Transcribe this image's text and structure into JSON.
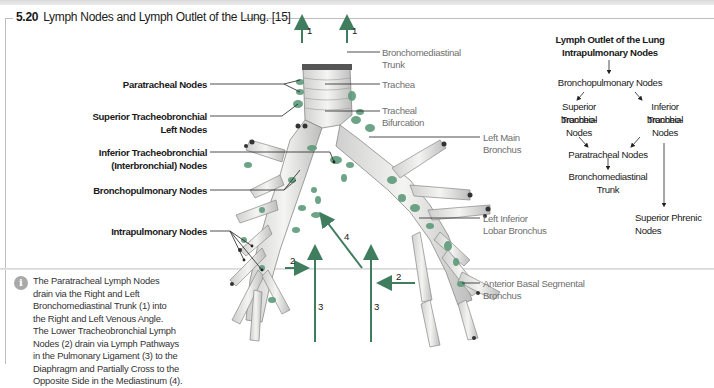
{
  "figure": {
    "number": "5.20",
    "title": "Lymph Nodes and Lymph Outlet of the Lung. [15]"
  },
  "colors": {
    "accent_green": "#3f7d5e",
    "node_green": "#5e9a7a",
    "label_grey": "#6f6f6f",
    "rule_grey": "#bdbdbd"
  },
  "left_labels": {
    "paratracheal": "Paratracheal Nodes",
    "sup_tracheo_1": "Superior Tracheobronchial",
    "sup_tracheo_2": "Left Nodes",
    "inf_tracheo_1": "Inferior Tracheobronchial",
    "inf_tracheo_2": "(Interbronchial) Nodes",
    "bronchopulmonary": "Bronchopulmonary Nodes",
    "intrapulmonary": "Intrapulmonary Nodes"
  },
  "right_labels": {
    "bronchomediastinal_1": "Bronchomediastinal",
    "bronchomediastinal_2": "Trunk",
    "trachea": "Trachea",
    "tracheal_bif_1": "Tracheal",
    "tracheal_bif_2": "Bifurcation",
    "left_main_1": "Left Main",
    "left_main_2": "Bronchus",
    "left_inferior_1": "Left Inferior",
    "left_inferior_2": "Lobar Bronchus",
    "ant_basal_1": "Anterior Basal Segmental",
    "ant_basal_2": "Bronchus"
  },
  "arrow_numbers": {
    "trunk_left": "1",
    "trunk_right": "1",
    "lower_left": "2",
    "lower_right": "2",
    "ligament_left": "3",
    "ligament_right": "3",
    "cross": "4"
  },
  "flowchart": {
    "title_1": "Lymph Outlet of the Lung",
    "title_2": "Intrapulmonary Nodes",
    "bronchopulmonary": "Bronchopulmonary Nodes",
    "superior_1": "Superior Tracheo-",
    "superior_2": "bronchial",
    "superior_3": "Nodes",
    "inferior_1": "Inferior Tracheo-",
    "inferior_2": "bronchial",
    "inferior_3": "Nodes",
    "paratracheal": "Paratracheal Nodes",
    "trunk_1": "Bronchomediastinal",
    "trunk_2": "Trunk",
    "phrenic_1": "Superior Phrenic",
    "phrenic_2": "Nodes"
  },
  "note": {
    "icon": "info-icon",
    "lines": [
      "The Paratracheal Lymph Nodes",
      "drain via the Right and Left",
      "Bronchomediastinal Trunk (1) into",
      "the Right and Left Venous Angle.",
      "The Lower Tracheobronchial Lymph",
      "Nodes (2) drain via Lymph Pathways",
      "in the Pulmonary Ligament (3) to the",
      "Diaphragm and Partially Cross to the",
      "Opposite Side in the Mediastinum (4)."
    ]
  }
}
